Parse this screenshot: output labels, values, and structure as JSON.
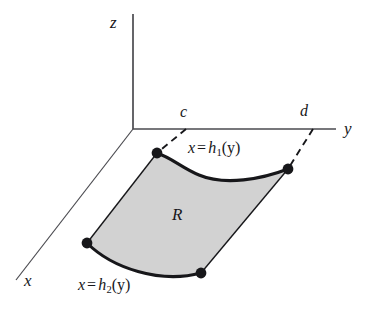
{
  "figure": {
    "axes": {
      "z": {
        "label": "z",
        "orientation": "vertical-up"
      },
      "y": {
        "label": "y",
        "orientation": "horizontal-right"
      },
      "x": {
        "label": "x",
        "orientation": "diagonal-down-left"
      },
      "origin": {
        "x": 133,
        "y": 129
      }
    },
    "bounds": {
      "lower_label": "c",
      "upper_label": "d"
    },
    "region": {
      "label": "R",
      "fill_color": "#d2d2d2",
      "stroke_color": "#17171a"
    },
    "curves": [
      {
        "name": "upper-boundary",
        "equation_x": "x",
        "equation_eq": "=",
        "equation_fn": "h",
        "equation_sub": "1",
        "equation_arg": "(y)"
      },
      {
        "name": "lower-boundary",
        "equation_x": "x",
        "equation_eq": "=",
        "equation_fn": "h",
        "equation_sub": "2",
        "equation_arg": "(y)"
      }
    ],
    "points": [
      {
        "name": "upper-left-vertex",
        "x": 157,
        "y": 153
      },
      {
        "name": "upper-right-vertex",
        "x": 288,
        "y": 169
      },
      {
        "name": "lower-left-vertex",
        "x": 87,
        "y": 243
      },
      {
        "name": "lower-right-vertex",
        "x": 201,
        "y": 273
      }
    ],
    "colors": {
      "ink": "#17171a",
      "axis": "#4a4a4f",
      "region_fill": "#d2d2d2",
      "background": "#ffffff"
    }
  }
}
